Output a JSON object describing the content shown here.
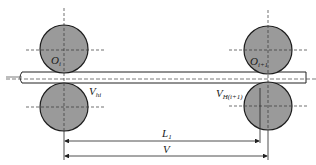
{
  "diagram": {
    "type": "rolling-mill-stands",
    "colors": {
      "roll_fill": "#9a9a9a",
      "roll_stroke": "#1e1e1e",
      "line": "#222222",
      "centerline": "#444444"
    },
    "rolls": [
      {
        "id": "upper-left",
        "label": "O",
        "sub": "i"
      },
      {
        "id": "upper-right",
        "label": "O",
        "sub": "i+1"
      },
      {
        "id": "lower-left",
        "label": "V",
        "sub": "hi"
      },
      {
        "id": "lower-right",
        "label": "V",
        "sub": "H(i+1)"
      }
    ],
    "dimensions": [
      {
        "label": "L",
        "sub": "1"
      },
      {
        "label": "V",
        "sub": ""
      }
    ]
  }
}
